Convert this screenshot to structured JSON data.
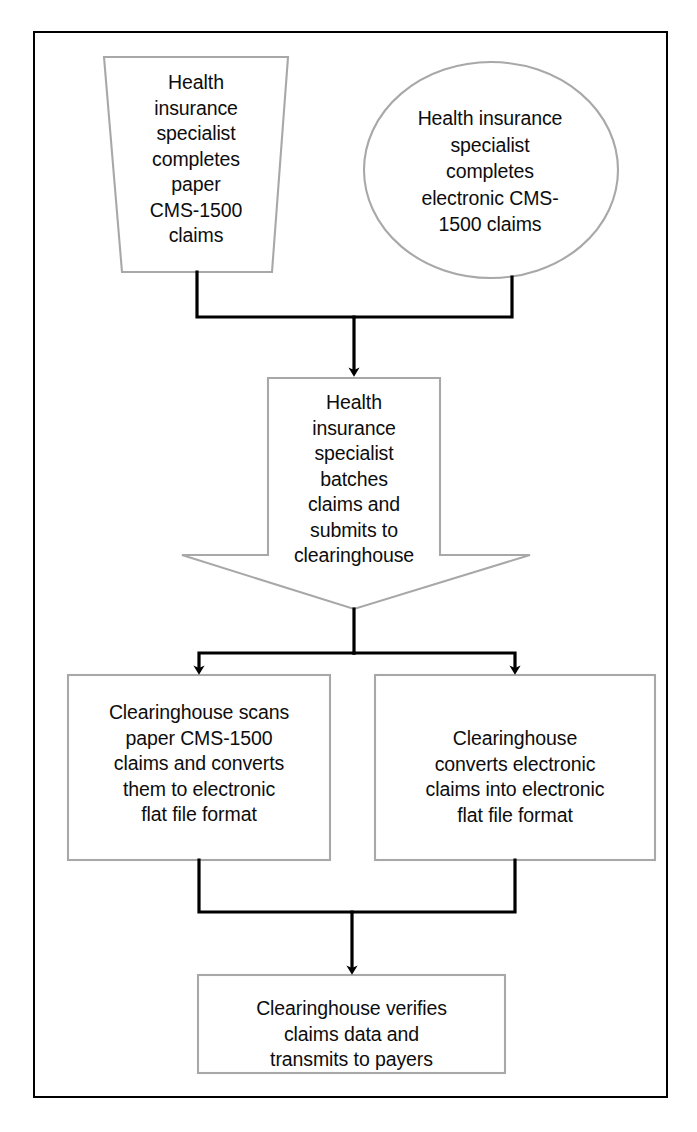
{
  "document": {
    "type": "flowchart",
    "title": "Health insurance claims submission workflow via clearinghouse",
    "page_width": 697,
    "page_height": 1132,
    "caption": ""
  },
  "colors": {
    "frame_border": "#000000",
    "shape_border": "#a8a8a8",
    "shape_fill": "#ffffff",
    "connector": "#000000",
    "text": "#0d0d0d",
    "page_background": "#ffffff"
  },
  "nodes": [
    {
      "id": "paper-claims",
      "shape": "trapezoid",
      "text": "Health\ninsurance\nspecialist\ncompletes\npaper\nCMS-1500\nclaims"
    },
    {
      "id": "electronic-claims",
      "shape": "ellipse",
      "text": "Health insurance\nspecialist\ncompletes\nelectronic CMS-\n1500 claims"
    },
    {
      "id": "batch-submit",
      "shape": "down-arrow",
      "text": "Health\ninsurance\nspecialist\nbatches\nclaims and\nsubmits to\nclearinghouse"
    },
    {
      "id": "scan-paper",
      "shape": "rectangle",
      "text": "Clearinghouse scans\npaper CMS-1500\nclaims and converts\nthem to electronic\nflat file format"
    },
    {
      "id": "convert-electronic",
      "shape": "rectangle",
      "text": "Clearinghouse\nconverts electronic\nclaims into electronic\nflat file format"
    },
    {
      "id": "verify-transmit",
      "shape": "rectangle",
      "text": "Clearinghouse verifies\nclaims data and\ntransmits to payers"
    }
  ],
  "connectors": [
    {
      "id": "paper-to-batch",
      "from": "paper-claims",
      "to": "batch-submit",
      "arrowhead": true
    },
    {
      "id": "electronic-to-batch",
      "from": "electronic-claims",
      "to": "batch-submit",
      "arrowhead": true
    },
    {
      "id": "batch-to-scan",
      "from": "batch-submit",
      "to": "scan-paper",
      "arrowhead": true
    },
    {
      "id": "batch-to-convert",
      "from": "batch-submit",
      "to": "convert-electronic",
      "arrowhead": true
    },
    {
      "id": "scan-to-verify",
      "from": "scan-paper",
      "to": "verify-transmit",
      "arrowhead": true
    },
    {
      "id": "convert-to-verify",
      "from": "convert-electronic",
      "to": "verify-transmit",
      "arrowhead": true
    }
  ]
}
